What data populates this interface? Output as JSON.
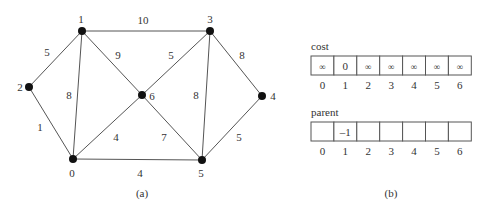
{
  "graph": {
    "caption": "(a)",
    "nodes": [
      {
        "id": "0",
        "x": 73,
        "y": 159,
        "lx": 72,
        "ly": 177,
        "anchor": "middle"
      },
      {
        "id": "1",
        "x": 82,
        "y": 31,
        "lx": 81,
        "ly": 23,
        "anchor": "middle"
      },
      {
        "id": "2",
        "x": 29,
        "y": 87,
        "lx": 20,
        "ly": 91,
        "anchor": "middle"
      },
      {
        "id": "3",
        "x": 210,
        "y": 31,
        "lx": 210,
        "ly": 23,
        "anchor": "middle"
      },
      {
        "id": "4",
        "x": 262,
        "y": 96,
        "lx": 273,
        "ly": 100,
        "anchor": "middle"
      },
      {
        "id": "5",
        "x": 202,
        "y": 160,
        "lx": 201,
        "ly": 177,
        "anchor": "middle"
      },
      {
        "id": "6",
        "x": 142,
        "y": 95,
        "lx": 152,
        "ly": 100,
        "anchor": "middle"
      }
    ],
    "edges": [
      {
        "from": "1",
        "to": "3",
        "weight": "10",
        "lx": 143,
        "ly": 24
      },
      {
        "from": "1",
        "to": "2",
        "weight": "5",
        "lx": 47,
        "ly": 56
      },
      {
        "from": "1",
        "to": "0",
        "weight": "8",
        "lx": 69,
        "ly": 99
      },
      {
        "from": "1",
        "to": "6",
        "weight": "9",
        "lx": 118,
        "ly": 59
      },
      {
        "from": "2",
        "to": "0",
        "weight": "1",
        "lx": 40,
        "ly": 131
      },
      {
        "from": "3",
        "to": "6",
        "weight": "5",
        "lx": 171,
        "ly": 59
      },
      {
        "from": "3",
        "to": "5",
        "weight": "8",
        "lx": 196,
        "ly": 99
      },
      {
        "from": "3",
        "to": "4",
        "weight": "8",
        "lx": 242,
        "ly": 59
      },
      {
        "from": "6",
        "to": "0",
        "weight": "4",
        "lx": 116,
        "ly": 141
      },
      {
        "from": "6",
        "to": "5",
        "weight": "7",
        "lx": 164,
        "ly": 141
      },
      {
        "from": "4",
        "to": "5",
        "weight": "5",
        "lx": 239,
        "ly": 141
      },
      {
        "from": "0",
        "to": "5",
        "weight": "4",
        "lx": 140,
        "ly": 177
      }
    ]
  },
  "arrays": {
    "caption": "(b)",
    "cost": {
      "label": "cost",
      "values": [
        "∞",
        "0",
        "∞",
        "∞",
        "∞",
        "∞",
        "∞"
      ],
      "indices": [
        "0",
        "1",
        "2",
        "3",
        "4",
        "5",
        "6"
      ]
    },
    "parent": {
      "label": "parent",
      "values": [
        "",
        "–1",
        "",
        "",
        "",
        "",
        ""
      ],
      "indices": [
        "0",
        "1",
        "2",
        "3",
        "4",
        "5",
        "6"
      ]
    }
  },
  "colors": {
    "edge": "#555555",
    "node": "#111111",
    "text": "#333333",
    "cell_border": "#555555"
  }
}
